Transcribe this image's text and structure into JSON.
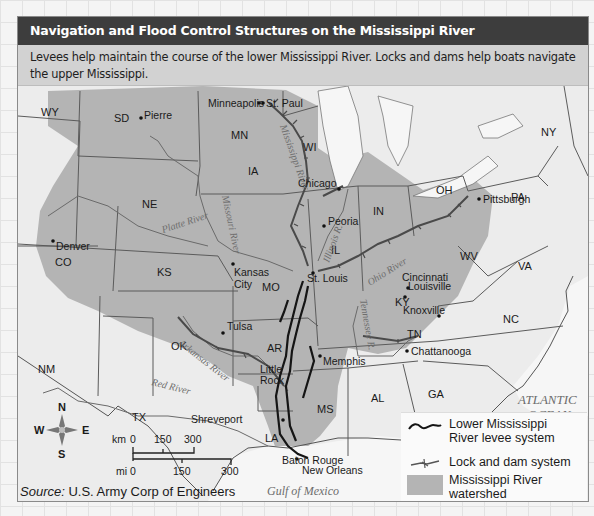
{
  "title": "Navigation and Flood Control Structures on the Mississippi River",
  "caption": "Levees help maintain the course of the lower Mississippi River. Locks and dams help boats navigate the upper Mississippi.",
  "map": {
    "states": [
      "WY",
      "SD",
      "MN",
      "WI",
      "NY",
      "NE",
      "IA",
      "PA",
      "OH",
      "IN",
      "IL",
      "CO",
      "KS",
      "MO",
      "WV",
      "VA",
      "KY",
      "TN",
      "NC",
      "OK",
      "AR",
      "NM",
      "TX",
      "LA",
      "MS",
      "AL",
      "GA"
    ],
    "cities": [
      "Minneapolis",
      "St. Paul",
      "Pierre",
      "Chicago",
      "Peoria",
      "Pittsburgh",
      "Denver",
      "Kansas City",
      "St. Louis",
      "Cincinnati",
      "Louisville",
      "Tulsa",
      "Knoxville",
      "Memphis",
      "Chattanooga",
      "Little Rock",
      "Shreveport",
      "Baton Rouge",
      "New Orleans"
    ],
    "rivers": [
      "Mississippi River",
      "Missouri River",
      "Platte River",
      "Illinois R.",
      "Ohio River",
      "Tennessee R.",
      "Arkansas River",
      "Red River"
    ],
    "water_bodies": [
      "ATLANTIC OCEAN",
      "Gulf of Mexico"
    ],
    "labels": {
      "wy": "WY",
      "sd": "SD",
      "mn": "MN",
      "wi": "WI",
      "ny": "NY",
      "ne": "NE",
      "ia": "IA",
      "pa": "PA",
      "oh": "OH",
      "in": "IN",
      "il": "IL",
      "co": "CO",
      "ks": "KS",
      "mo": "MO",
      "wv": "WV",
      "va": "VA",
      "ky": "KY",
      "tn": "TN",
      "nc": "NC",
      "ok": "OK",
      "ar": "AR",
      "nm": "NM",
      "tx": "TX",
      "la": "LA",
      "ms": "MS",
      "al": "AL",
      "ga": "GA",
      "minneapolis": "Minneapolis",
      "st_paul": "St. Paul",
      "pierre": "Pierre",
      "chicago": "Chicago",
      "peoria": "Peoria",
      "pittsburgh": "Pittsburgh",
      "denver": "Denver",
      "kansas": "Kansas",
      "city": "City",
      "st_louis": "St. Louis",
      "cincinnati": "Cincinnati",
      "louisville": "Louisville",
      "tulsa": "Tulsa",
      "knoxville": "Knoxville",
      "memphis": "Memphis",
      "chattanooga": "Chattanooga",
      "little": "Little",
      "rock": "Rock",
      "shreveport": "Shreveport",
      "baton_rouge": "Baton Rouge",
      "new_orleans": "New Orleans",
      "mississippi_river": "Mississippi River",
      "missouri_river": "Missouri River",
      "platte_river": "Platte River",
      "illinois_r": "Illinois R.",
      "ohio_river": "Ohio River",
      "tennessee_r": "Tennessee R.",
      "arkansas_river": "Arkansas River",
      "red_river": "Red River",
      "atlantic": "ATLANTIC",
      "ocean": "OCEAN",
      "gulf": "Gulf of Mexico"
    }
  },
  "compass": {
    "n": "N",
    "s": "S",
    "e": "E",
    "w": "W"
  },
  "scale": {
    "km_label": "km",
    "km_ticks": [
      "0",
      "150",
      "300"
    ],
    "mi_label": "mi",
    "mi_ticks": [
      "0",
      "150",
      "300"
    ]
  },
  "legend": {
    "items": [
      {
        "symbol": "levee-line",
        "label": "Lower Mississippi River levee system"
      },
      {
        "symbol": "lock-dam-line",
        "label": "Lock and dam system"
      },
      {
        "symbol": "watershed-swatch",
        "label": "Mississippi River watershed"
      }
    ],
    "item0_line1": "Lower Mississippi",
    "item0_line2": "River levee system",
    "item1": "Lock and dam system",
    "item2_line1": "Mississippi River",
    "item2_line2": "watershed"
  },
  "source": {
    "prefix": "Source:",
    "text": " U.S. Army Corp of Engineers"
  },
  "colors": {
    "title_bar": "#3d3d3d",
    "caption_bg": "#d2d2d2",
    "watershed": "#b4b4b4",
    "land": "#ececec",
    "levee": "#151515",
    "lock_dam": "#5a5a5a"
  }
}
